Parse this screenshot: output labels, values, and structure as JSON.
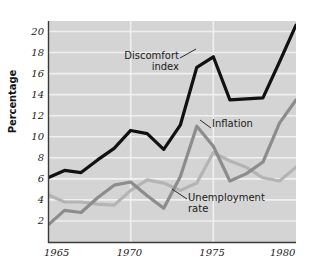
{
  "chart_data": {
    "type": "line",
    "title": "",
    "xlabel": "",
    "ylabel": "Percentage",
    "xlim": [
      1965,
      1980
    ],
    "ylim": [
      0,
      21
    ],
    "grid": "horizontal-white-gridlines-plus-year-verticals",
    "legend": "inline-annotations-with-leader-lines",
    "background": "#d4d4d4",
    "x": [
      1965,
      1966,
      1967,
      1968,
      1969,
      1970,
      1971,
      1972,
      1973,
      1974,
      1975,
      1976,
      1977,
      1978,
      1979,
      1980
    ],
    "xticks": [
      "1965",
      "1970",
      "1975",
      "1980"
    ],
    "xtick_values": [
      1965,
      1970,
      1975,
      1980
    ],
    "yticks": [
      "2",
      "4",
      "6",
      "8",
      "10",
      "12",
      "14",
      "16",
      "18",
      "20"
    ],
    "ytick_values": [
      2,
      4,
      6,
      8,
      10,
      12,
      14,
      16,
      18,
      20
    ],
    "series": [
      {
        "name": "Discomfort index",
        "color": "#111111",
        "width": 3.2,
        "values": [
          6.1,
          6.8,
          6.6,
          7.8,
          8.9,
          10.6,
          10.3,
          8.8,
          11.1,
          16.6,
          17.6,
          13.5,
          13.6,
          13.7,
          17.1,
          20.6
        ]
      },
      {
        "name": "Inflation",
        "color": "#8c8c8c",
        "width": 3.2,
        "values": [
          1.6,
          3.0,
          2.8,
          4.2,
          5.4,
          5.7,
          4.4,
          3.2,
          6.2,
          11.0,
          9.1,
          5.8,
          6.5,
          7.6,
          11.3,
          13.5
        ]
      },
      {
        "name": "Unemployment rate",
        "color": "#b4b4b4",
        "width": 3.2,
        "values": [
          4.5,
          3.8,
          3.8,
          3.6,
          3.5,
          4.9,
          5.9,
          5.6,
          4.9,
          5.6,
          8.5,
          7.7,
          7.1,
          6.1,
          5.8,
          7.1
        ]
      }
    ],
    "annotations": [
      {
        "id": "discomfort",
        "text": "Discomfort\nindex",
        "target_series": "Discomfort index"
      },
      {
        "id": "inflation",
        "text": "Inflation",
        "target_series": "Inflation"
      },
      {
        "id": "unemployment",
        "text": "Unemployment\nrate",
        "target_series": "Unemployment rate"
      }
    ]
  }
}
